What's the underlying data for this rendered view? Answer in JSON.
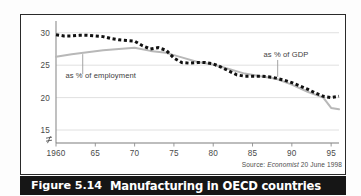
{
  "figure": {
    "caption_number": "Figure 5.14",
    "caption_title": "Manufacturing in OECD countries",
    "source_prefix": "Source:",
    "source_publication": "Economist",
    "source_date": "20 June 1998",
    "frame_color": "#2a2a2a",
    "caption_bar_color": "#161616",
    "caption_text_color": "#ffffff"
  },
  "chart_data": {
    "type": "line",
    "title": "Manufacturing in OECD countries",
    "xlabel": "",
    "ylabel": "",
    "xlim": [
      1960,
      1996
    ],
    "ylim": [
      13,
      31.5
    ],
    "yticks": [
      15,
      20,
      25,
      30
    ],
    "ytick_labels": [
      "15",
      "20",
      "25",
      "30"
    ],
    "xticks": [
      1960,
      1965,
      1970,
      1975,
      1980,
      1985,
      1990,
      1995
    ],
    "xtick_labels": [
      "1960",
      "65",
      "70",
      "75",
      "80",
      "85",
      "90",
      "95"
    ],
    "grid": "horizontal",
    "axis_break_symbol": "≈",
    "legend_position": "inline-annotations",
    "annotations": [
      {
        "text": "as % of employment",
        "series": "employment",
        "text_x": 1961.2,
        "text_y": 23.0,
        "leader_from_x": 1963.4,
        "leader_from_y": 23.6,
        "leader_to_x": 1963.4,
        "leader_to_y": 26.7
      },
      {
        "text": "as % of GDP",
        "series": "gdp",
        "text_x": 1986.4,
        "text_y": 26.3,
        "leader_from_x": 1988.2,
        "leader_from_y": 25.8,
        "leader_to_x": 1988.2,
        "leader_to_y": 23.2
      }
    ],
    "series": [
      {
        "name": "as % of GDP",
        "style": "dotted",
        "color": "#111111",
        "x": [
          1960,
          1961,
          1962,
          1963,
          1964,
          1965,
          1966,
          1967,
          1968,
          1969,
          1970,
          1971,
          1972,
          1973,
          1974,
          1975,
          1976,
          1977,
          1978,
          1979,
          1980,
          1981,
          1982,
          1983,
          1984,
          1985,
          1986,
          1987,
          1988,
          1989,
          1990,
          1991,
          1992,
          1993,
          1994,
          1995,
          1996
        ],
        "values": [
          29.7,
          29.5,
          29.5,
          29.6,
          29.6,
          29.5,
          29.4,
          29.1,
          28.9,
          28.8,
          28.7,
          28.0,
          27.5,
          27.7,
          27.3,
          26.1,
          25.4,
          25.3,
          25.4,
          25.4,
          25.2,
          24.7,
          24.1,
          23.5,
          23.3,
          23.3,
          23.3,
          23.2,
          23.0,
          22.7,
          22.3,
          21.8,
          21.3,
          20.7,
          20.2,
          20.0,
          20.2
        ]
      },
      {
        "name": "as % of employment",
        "style": "solid",
        "color": "#b8b8b8",
        "x": [
          1960,
          1962,
          1964,
          1966,
          1968,
          1970,
          1972,
          1974,
          1976,
          1978,
          1980,
          1982,
          1984,
          1986,
          1988,
          1990,
          1992,
          1994,
          1995,
          1996
        ],
        "values": [
          26.3,
          26.7,
          27.0,
          27.3,
          27.5,
          27.7,
          27.2,
          26.9,
          26.2,
          25.5,
          25.1,
          24.4,
          23.7,
          23.3,
          22.9,
          22.0,
          20.9,
          20.0,
          18.4,
          18.2
        ]
      }
    ]
  }
}
